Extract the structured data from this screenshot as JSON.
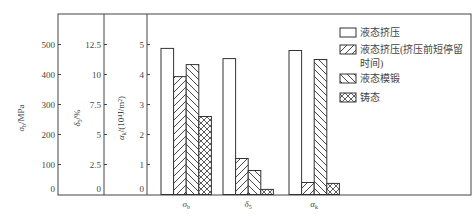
{
  "chart_data": {
    "type": "bar",
    "title": "",
    "categories": [
      "σb",
      "δ5",
      "αk"
    ],
    "category_labels": [
      {
        "main": "σ",
        "sub": "b"
      },
      {
        "main": "δ",
        "sub": "5"
      },
      {
        "main": "α",
        "sub": "k"
      }
    ],
    "axes": [
      {
        "name": "sigma_b",
        "label_main": "σ",
        "label_sub": "b",
        "label_unit": "/MPa",
        "ticks": [
          "0",
          "100",
          "200",
          "300",
          "400",
          "500"
        ],
        "range": [
          0,
          600
        ]
      },
      {
        "name": "delta_5",
        "label_main": "δ",
        "label_sub": "5",
        "label_unit": "/%",
        "ticks": [
          "0",
          "2.5",
          "5",
          "7.5",
          "10",
          "12.5"
        ],
        "range": [
          0,
          15
        ]
      },
      {
        "name": "alpha_k",
        "label_main": "α",
        "label_sub": "k",
        "label_unit": "/(10⁴J/m²)",
        "ticks": [
          "0",
          "1",
          "2",
          "3",
          "4",
          "5"
        ],
        "range": [
          0,
          6
        ]
      }
    ],
    "series": [
      {
        "name": "液态挤压",
        "pattern": "none",
        "values_scaled": [
          4.87,
          4.53,
          4.8
        ],
        "values": [
          487,
          11.3,
          4.8
        ]
      },
      {
        "name": "液态挤压(挤压前短停留时间)",
        "pattern": "diag-right",
        "values_scaled": [
          3.93,
          1.2,
          0.4
        ],
        "values": [
          393,
          3.0,
          0.4
        ]
      },
      {
        "name": "液态模锻",
        "pattern": "diag-left",
        "values_scaled": [
          4.33,
          0.8,
          4.5
        ],
        "values": [
          433,
          2.0,
          4.5
        ]
      },
      {
        "name": "铸态",
        "pattern": "cross",
        "values_scaled": [
          2.6,
          0.17,
          0.37
        ],
        "values": [
          260,
          0.4,
          0.37
        ]
      }
    ],
    "legend": {
      "position": "right-inside",
      "entries": [
        {
          "line1": "液态挤压",
          "line2": ""
        },
        {
          "line1": "液态挤压(挤压前短停留",
          "line2": "时间)"
        },
        {
          "line1": "液态模锻",
          "line2": ""
        },
        {
          "line1": "铸态",
          "line2": ""
        }
      ]
    },
    "grid": false,
    "xlabel": "",
    "ylabel": "σb/MPa ; δ5/% ; αk/(10⁴J/m²)"
  }
}
